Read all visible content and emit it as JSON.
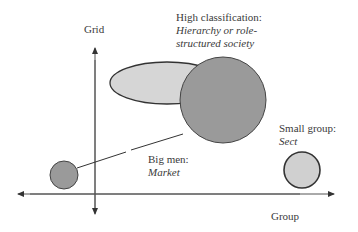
{
  "axes": {
    "vertical_label": "Grid",
    "horizontal_label": "Group"
  },
  "labels": {
    "high_classification": {
      "title": "High classification:",
      "line1": "Hierarchy or role-",
      "line2": "structured society"
    },
    "big_men": {
      "title": "Big men:",
      "subtitle": "Market"
    },
    "small_group": {
      "title": "Small group:",
      "subtitle": "Sect"
    }
  },
  "colors": {
    "ellipse_fill": "#d6d6d6",
    "big_circle_fill": "#9a9a9a",
    "small_left_fill": "#9a9a9a",
    "sect_fill": "#d0d0d0",
    "stroke": "#333333"
  }
}
